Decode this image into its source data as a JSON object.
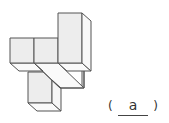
{
  "figure": {
    "colors": {
      "front_face": "#ededed",
      "side_face": "#f8f8f8",
      "top_face": "#ffffff",
      "edge": "#555555"
    }
  },
  "answer": {
    "open_paren": "(",
    "value": "a",
    "close_paren": ")"
  }
}
